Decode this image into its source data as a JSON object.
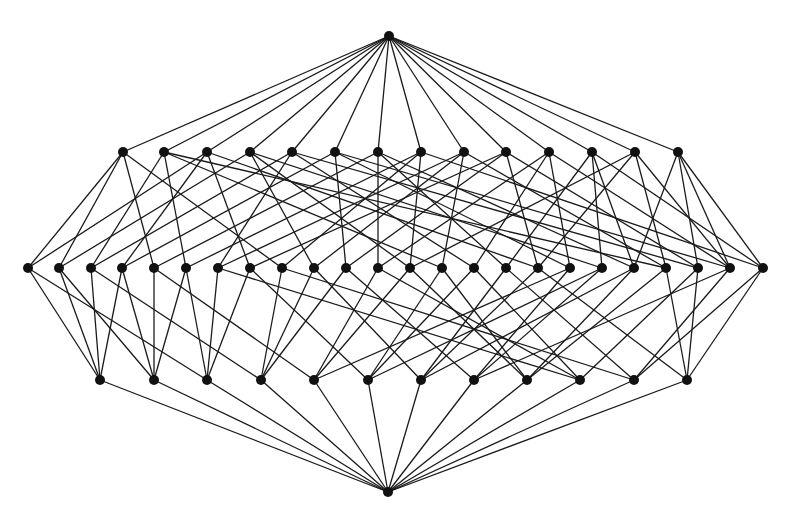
{
  "diagram": {
    "type": "hasse-diagram",
    "colors": {
      "edge": "#1a1a1a",
      "node": "#111111",
      "background": "#ffffff"
    },
    "node_radius": 5,
    "levels": [
      {
        "name": "top",
        "y": 36,
        "x": [
          389
        ]
      },
      {
        "name": "level-1",
        "y": 152,
        "x": [
          123,
          164,
          207,
          250,
          292,
          335,
          378,
          421,
          464,
          506,
          549,
          592,
          635,
          678
        ]
      },
      {
        "name": "level-2",
        "y": 268,
        "x": [
          28,
          59,
          91,
          122,
          154,
          186,
          218,
          250,
          282,
          314,
          346,
          378,
          410,
          442,
          474,
          506,
          538,
          570,
          602,
          634,
          666,
          698,
          730,
          763
        ]
      },
      {
        "name": "level-3",
        "y": 380,
        "x": [
          100,
          154,
          207,
          261,
          314,
          368,
          421,
          474,
          527,
          580,
          634,
          687
        ]
      },
      {
        "name": "bottom",
        "y": 492,
        "x": [
          388
        ]
      }
    ],
    "edges_top_to_1": "all",
    "edges_3_to_bottom": "all",
    "edges_1_to_2": [
      [
        0,
        0
      ],
      [
        0,
        1
      ],
      [
        0,
        4
      ],
      [
        0,
        8
      ],
      [
        1,
        2
      ],
      [
        1,
        5
      ],
      [
        1,
        13
      ],
      [
        1,
        20
      ],
      [
        2,
        0
      ],
      [
        2,
        3
      ],
      [
        2,
        7
      ],
      [
        2,
        16
      ],
      [
        3,
        1
      ],
      [
        3,
        9
      ],
      [
        3,
        12
      ],
      [
        3,
        18
      ],
      [
        4,
        2
      ],
      [
        4,
        6
      ],
      [
        4,
        14
      ],
      [
        4,
        21
      ],
      [
        5,
        3
      ],
      [
        5,
        10
      ],
      [
        5,
        17
      ],
      [
        5,
        22
      ],
      [
        6,
        4
      ],
      [
        6,
        11
      ],
      [
        6,
        15
      ],
      [
        6,
        19
      ],
      [
        7,
        5
      ],
      [
        7,
        8
      ],
      [
        7,
        12
      ],
      [
        7,
        23
      ],
      [
        8,
        6
      ],
      [
        8,
        9
      ],
      [
        8,
        13
      ],
      [
        8,
        20
      ],
      [
        9,
        7
      ],
      [
        9,
        10
      ],
      [
        9,
        16
      ],
      [
        9,
        21
      ],
      [
        10,
        11
      ],
      [
        10,
        14
      ],
      [
        10,
        17
      ],
      [
        10,
        22
      ],
      [
        11,
        15
      ],
      [
        11,
        18
      ],
      [
        11,
        19
      ],
      [
        11,
        23
      ],
      [
        12,
        12
      ],
      [
        12,
        16
      ],
      [
        12,
        20
      ],
      [
        12,
        22
      ],
      [
        13,
        19
      ],
      [
        13,
        21
      ],
      [
        13,
        22
      ],
      [
        13,
        23
      ]
    ],
    "edges_2_to_3": [
      [
        0,
        0
      ],
      [
        1,
        0
      ],
      [
        2,
        0
      ],
      [
        3,
        0
      ],
      [
        0,
        2
      ],
      [
        1,
        1
      ],
      [
        2,
        3
      ],
      [
        3,
        1
      ],
      [
        4,
        1
      ],
      [
        4,
        4
      ],
      [
        5,
        1
      ],
      [
        5,
        2
      ],
      [
        6,
        2
      ],
      [
        7,
        2
      ],
      [
        7,
        5
      ],
      [
        8,
        3
      ],
      [
        9,
        3
      ],
      [
        10,
        3
      ],
      [
        11,
        4
      ],
      [
        12,
        4
      ],
      [
        13,
        5
      ],
      [
        14,
        5
      ],
      [
        15,
        6
      ],
      [
        16,
        6
      ],
      [
        9,
        6
      ],
      [
        17,
        7
      ],
      [
        18,
        7
      ],
      [
        19,
        8
      ],
      [
        20,
        8
      ],
      [
        12,
        8
      ],
      [
        21,
        9
      ],
      [
        22,
        10
      ],
      [
        23,
        10
      ],
      [
        23,
        11
      ],
      [
        20,
        11
      ],
      [
        21,
        11
      ],
      [
        6,
        9
      ],
      [
        10,
        7
      ],
      [
        13,
        8
      ],
      [
        14,
        9
      ],
      [
        15,
        10
      ],
      [
        16,
        11
      ],
      [
        17,
        4
      ],
      [
        18,
        5
      ],
      [
        19,
        6
      ],
      [
        22,
        7
      ],
      [
        11,
        9
      ],
      [
        8,
        10
      ]
    ]
  }
}
